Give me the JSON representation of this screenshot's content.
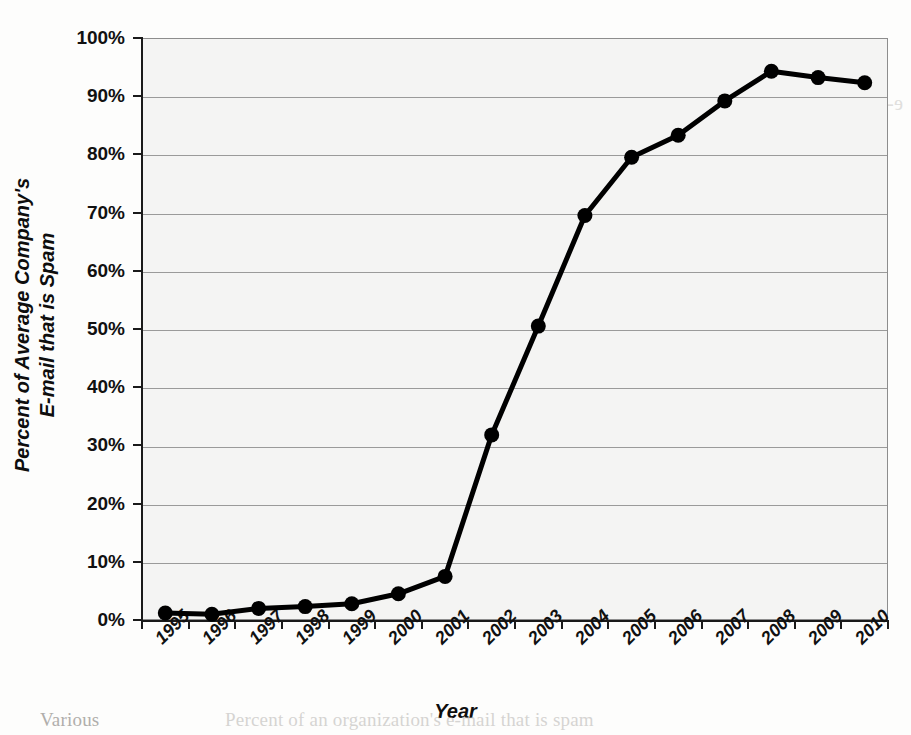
{
  "chart_data": {
    "type": "line",
    "title": "",
    "xlabel": "Year",
    "ylabel": "Percent of Average Company's E-mail that is Spam",
    "ylabel_line1": "Percent of Average Company's",
    "ylabel_line2": "E-mail that is Spam",
    "categories": [
      "1995",
      "1996",
      "1997",
      "1998",
      "1999",
      "2000",
      "2001",
      "2002",
      "2003",
      "2004",
      "2005",
      "2006",
      "2007",
      "2008",
      "2009",
      "2010"
    ],
    "values": [
      1.2,
      1.0,
      2.0,
      2.3,
      2.8,
      4.5,
      7.5,
      31.8,
      50.5,
      69.5,
      79.5,
      83.3,
      89.2,
      94.3,
      93.2,
      92.3
    ],
    "series": [
      {
        "name": "Percent of Average Company's E-mail that is Spam",
        "values": [
          1.2,
          1.0,
          2.0,
          2.3,
          2.8,
          4.5,
          7.5,
          31.8,
          50.5,
          69.5,
          79.5,
          83.3,
          89.2,
          94.3,
          93.2,
          92.3
        ]
      }
    ],
    "ylim": [
      0,
      100
    ],
    "ytick_labels": [
      "0%",
      "10%",
      "20%",
      "30%",
      "40%",
      "50%",
      "60%",
      "70%",
      "80%",
      "90%",
      "100%"
    ],
    "ytick_values": [
      0,
      10,
      20,
      30,
      40,
      50,
      60,
      70,
      80,
      90,
      100
    ],
    "grid": true,
    "legend": "none",
    "marker": "filled-circle",
    "line_color": "#000000",
    "marker_color": "#000000",
    "plot_background": "#f4f4f3",
    "grid_color": "#9a9a9a"
  },
  "page_ghost_text": {
    "lines": [
      "petite",
      "e-mail can be a very well perceived spam image. It was that one reason for",
      "traditionally attractive the Internet. e-mail conveys messages from",
      "of up to a few seconds, and one can contain single e-mail text, or data",
      "for formatting similar to word processing programs.",
      "and feature of e-mail is that documents, pictures, movies, workbooks, and",
      "can be sent along with the message itself. These attachments are treated",
      "as part of the message. Users use e-mail message attachments mainly",
      "without having to mail or deliver hard copy through the postal service.",
      "using electronic commerce systems need to confirm the receipt of orders",
      "in the same manner, using electronic mail. Certain e-mail can now serve",
      "without a postage to the buyer.",
      "drawbacks",
      "many benefits, e-mail does have some drawbacks. One disturbance issue",
      "is the amount of time and attention required to process the mail. Some",
      "studies found that most managers can deal with well over 150 e-mails"
    ],
    "bottom_line_left": "Various",
    "bottom_line_right": "Percent of an organization's e-mail that is spam"
  }
}
